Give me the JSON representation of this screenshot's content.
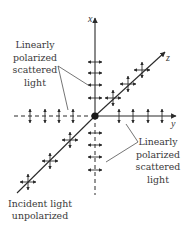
{
  "diagram": {
    "colors": {
      "ink": "#2a2a2a",
      "text": "#3a3a3a",
      "background": "#ffffff"
    },
    "origin": {
      "x": 95,
      "y": 116
    },
    "axes": {
      "x": {
        "label": "x",
        "from": [
          95,
          116
        ],
        "to": [
          95,
          18
        ],
        "label_pos": [
          88,
          22
        ]
      },
      "y": {
        "label": "y",
        "from": [
          95,
          116
        ],
        "to": [
          176,
          116
        ],
        "label_pos": [
          172,
          127
        ]
      },
      "z": {
        "label": "z",
        "from": [
          95,
          116
        ],
        "to": [
          165,
          52
        ],
        "label_pos": [
          166,
          61
        ]
      },
      "neg_x": {
        "from": [
          95,
          116
        ],
        "to": [
          95,
          195
        ],
        "dashed": true
      },
      "neg_y": {
        "from": [
          95,
          116
        ],
        "to": [
          14,
          116
        ],
        "dashed": true
      },
      "incident": {
        "from": [
          17,
          193
        ],
        "to": [
          95,
          116
        ]
      }
    },
    "labels": {
      "upper_left": {
        "lines": [
          "Linearly",
          "polarized",
          "scattered",
          "light"
        ],
        "center_x": 35,
        "line_y": [
          48,
          61,
          73,
          86
        ]
      },
      "lower_right": {
        "lines": [
          "Linearly",
          "polarized",
          "scattered",
          "light"
        ],
        "center_x": 158,
        "line_y": [
          145,
          158,
          170,
          183
        ]
      },
      "incident": {
        "lines": [
          "Incident light",
          "unpolarized"
        ],
        "center_x": 40,
        "line_y": [
          207,
          219
        ]
      }
    },
    "arrows": {
      "pos_x_horizontal": [
        62,
        73,
        85,
        98
      ],
      "neg_x_horizontal": [
        133,
        145,
        157,
        170
      ],
      "pos_y_vertical": [
        119,
        133,
        148,
        162
      ],
      "neg_y_vertical": [
        30,
        45,
        59,
        73
      ],
      "diag_upper_crossed": [
        [
          113,
          98
        ],
        [
          128,
          84
        ],
        [
          142,
          70
        ]
      ],
      "diag_lower_crossed": [
        [
          70,
          140
        ],
        [
          50,
          161
        ],
        [
          28,
          182
        ]
      ]
    },
    "leaders": {
      "upper_left": [
        [
          [
            58,
            66
          ],
          [
            88,
            85
          ]
        ],
        [
          [
            58,
            66
          ],
          [
            68,
            110
          ]
        ]
      ],
      "lower_right": [
        [
          [
            138,
            142
          ],
          [
            126,
            124
          ]
        ],
        [
          [
            138,
            142
          ],
          [
            106,
            162
          ]
        ]
      ]
    }
  }
}
